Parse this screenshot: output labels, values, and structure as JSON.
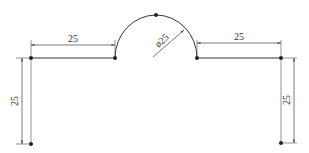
{
  "drawing": {
    "type": "technical-dimension-drawing",
    "line_color": "#333333",
    "dim_color": "#555555",
    "dimensions": {
      "left_horizontal": "25",
      "right_horizontal": "25",
      "arc_diameter": "ø25",
      "left_vertical": "25",
      "right_vertical": "25"
    },
    "points": [
      {
        "name": "left-top",
        "x": 31,
        "y": 58
      },
      {
        "name": "arc-left",
        "x": 115,
        "y": 58
      },
      {
        "name": "arc-top",
        "x": 156,
        "y": 15
      },
      {
        "name": "arc-right",
        "x": 197,
        "y": 58
      },
      {
        "name": "right-top",
        "x": 281,
        "y": 58
      },
      {
        "name": "left-bottom",
        "x": 31,
        "y": 144
      },
      {
        "name": "right-bottom",
        "x": 281,
        "y": 143
      }
    ]
  }
}
